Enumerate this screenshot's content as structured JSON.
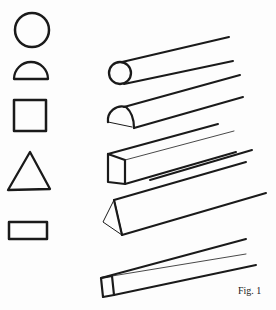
{
  "figure": {
    "caption": "Fig. 1",
    "ink_color": "#1a1a1a",
    "profiles": [
      {
        "name": "circle"
      },
      {
        "name": "half-circle"
      },
      {
        "name": "square"
      },
      {
        "name": "triangle"
      },
      {
        "name": "rectangle"
      }
    ],
    "bars": [
      {
        "name": "round-bar"
      },
      {
        "name": "half-round-bar"
      },
      {
        "name": "square-bar"
      },
      {
        "name": "triangular-bar"
      },
      {
        "name": "flat-bar"
      }
    ]
  }
}
